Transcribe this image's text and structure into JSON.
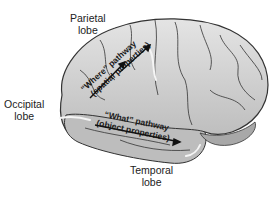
{
  "labels": {
    "parietal": [
      "Parietal",
      "lobe"
    ],
    "occipital": [
      "Occipital",
      "lobe"
    ],
    "temporal": [
      "Temporal",
      "lobe"
    ]
  },
  "pathways": {
    "where": {
      "line1": "“Where” pathway",
      "line2": "(spatial properties)"
    },
    "what": {
      "line1": "“What” pathway",
      "line2": "(object properties)"
    }
  },
  "colors": {
    "brain_fill": "#c9c9c9",
    "brain_outline": "#333333",
    "highlight": "#f2f2f2",
    "text": "#222222"
  }
}
